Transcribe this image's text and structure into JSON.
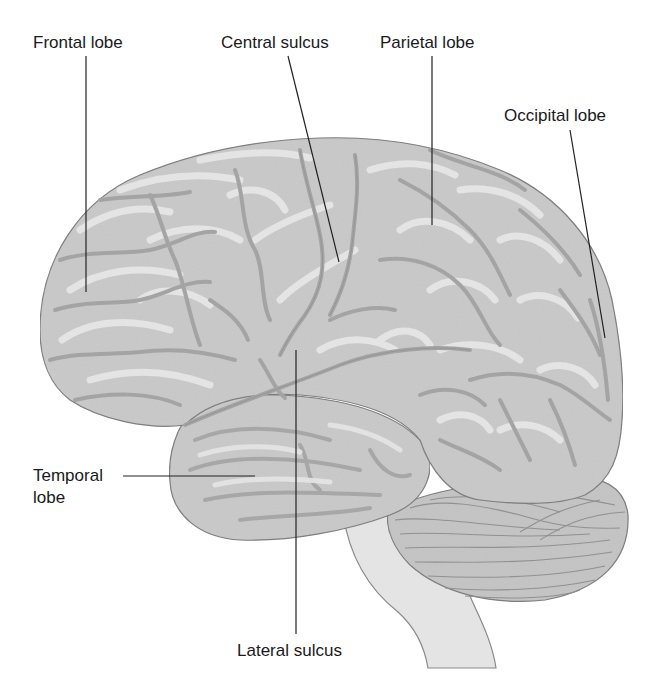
{
  "diagram": {
    "labels": {
      "frontal_lobe": "Frontal lobe",
      "central_sulcus": "Central sulcus",
      "parietal_lobe": "Parietal lobe",
      "occipital_lobe": "Occipital lobe",
      "temporal_lobe_line1": "Temporal",
      "temporal_lobe_line2": "lobe",
      "lateral_sulcus": "Lateral sulcus"
    },
    "colors": {
      "cortex_fill": "#c9c9c9",
      "gyrus_highlight": "#e6e6e6",
      "sulcus_shade": "#a8a8a8",
      "outline": "#7a7a7a",
      "cerebellum_fill": "#c4c4c4",
      "brainstem_fill": "#e4e4e4",
      "leader_line": "#222222",
      "text": "#1a1a1a"
    }
  }
}
